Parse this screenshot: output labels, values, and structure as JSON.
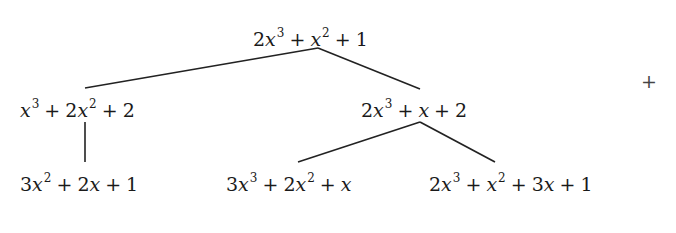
{
  "diagram": {
    "type": "tree",
    "line_color": "#222222",
    "nodes": [
      {
        "id": "root",
        "label": "2x^3 + x^2 + 1",
        "parts": {
          "a": "2",
          "b": "x",
          "c": "3",
          "d": "+",
          "e": "x",
          "f": "2",
          "g": "+",
          "h": "1"
        }
      },
      {
        "id": "left",
        "label": "x^3 + 2x^2 + 2",
        "parts": {
          "a": "x",
          "b": "3",
          "c": "+",
          "d": "2",
          "e": "x",
          "f": "2",
          "g": "+",
          "h": "2"
        }
      },
      {
        "id": "right",
        "label": "2x^3 + x + 2",
        "parts": {
          "a": "2",
          "b": "x",
          "c": "3",
          "d": "+",
          "e": "x",
          "f": "+",
          "g": "2"
        }
      },
      {
        "id": "left-child",
        "label": "3x^2 + 2x + 1",
        "parts": {
          "a": "3",
          "b": "x",
          "c": "2",
          "d": "+",
          "e": "2",
          "f": "x",
          "g": "+",
          "h": "1"
        }
      },
      {
        "id": "right-left-child",
        "label": "3x^3 + 2x^2 + x",
        "parts": {
          "a": "3",
          "b": "x",
          "c": "3",
          "d": "+",
          "e": "2",
          "f": "x",
          "g": "2",
          "h": "+",
          "i": "x"
        }
      },
      {
        "id": "right-right-child",
        "label": "2x^3 + x^2 + 3x + 1",
        "parts": {
          "a": "2",
          "b": "x",
          "c": "3",
          "d": "+",
          "e": "x",
          "f": "2",
          "g": "+",
          "h": "3",
          "i": "x",
          "j": "+",
          "k": "1"
        }
      }
    ],
    "edges": [
      [
        "root",
        "left"
      ],
      [
        "root",
        "right"
      ],
      [
        "left",
        "left-child"
      ],
      [
        "right",
        "right-left-child"
      ],
      [
        "right",
        "right-right-child"
      ]
    ],
    "stray_symbol": "+"
  }
}
